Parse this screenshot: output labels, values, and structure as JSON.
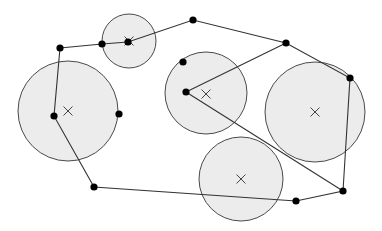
{
  "diagram": {
    "width": 382,
    "height": 231,
    "colors": {
      "circle_fill": "#ececec",
      "circle_stroke": "#4a4a4a",
      "edge": "#333333",
      "point": "#000000",
      "center_mark": "#444444"
    },
    "circles": [
      {
        "id": "top-small",
        "cx": 129,
        "cy": 41,
        "r": 27
      },
      {
        "id": "left-large",
        "cx": 68,
        "cy": 111,
        "r": 50
      },
      {
        "id": "middle",
        "cx": 206,
        "cy": 93,
        "r": 41
      },
      {
        "id": "right-large",
        "cx": 315,
        "cy": 112,
        "r": 50
      },
      {
        "id": "bottom",
        "cx": 241,
        "cy": 179,
        "r": 42
      }
    ],
    "center_marks": [
      {
        "x": 129,
        "y": 41
      },
      {
        "x": 68,
        "y": 111
      },
      {
        "x": 206,
        "y": 94
      },
      {
        "x": 315,
        "y": 112
      },
      {
        "x": 241,
        "y": 179
      }
    ],
    "points": [
      {
        "x": 60,
        "y": 48
      },
      {
        "x": 102,
        "y": 44
      },
      {
        "x": 128,
        "y": 42
      },
      {
        "x": 193,
        "y": 20
      },
      {
        "x": 286,
        "y": 43
      },
      {
        "x": 350,
        "y": 78
      },
      {
        "x": 343,
        "y": 191
      },
      {
        "x": 296,
        "y": 201
      },
      {
        "x": 94,
        "y": 187
      },
      {
        "x": 54,
        "y": 116
      },
      {
        "x": 119,
        "y": 114
      },
      {
        "x": 183,
        "y": 62
      },
      {
        "x": 186,
        "y": 92
      }
    ],
    "polygon_path": [
      [
        60,
        48
      ],
      [
        102,
        44
      ],
      [
        128,
        42
      ],
      [
        193,
        20
      ],
      [
        286,
        43
      ],
      [
        350,
        78
      ],
      [
        343,
        191
      ],
      [
        296,
        201
      ],
      [
        94,
        187
      ],
      [
        54,
        116
      ],
      [
        60,
        48
      ]
    ],
    "extra_edges": [
      [
        [
          286,
          43
        ],
        [
          186,
          92
        ]
      ],
      [
        [
          186,
          92
        ],
        [
          343,
          191
        ]
      ]
    ],
    "point_radius": 3.6,
    "mark_size": 4.5
  }
}
